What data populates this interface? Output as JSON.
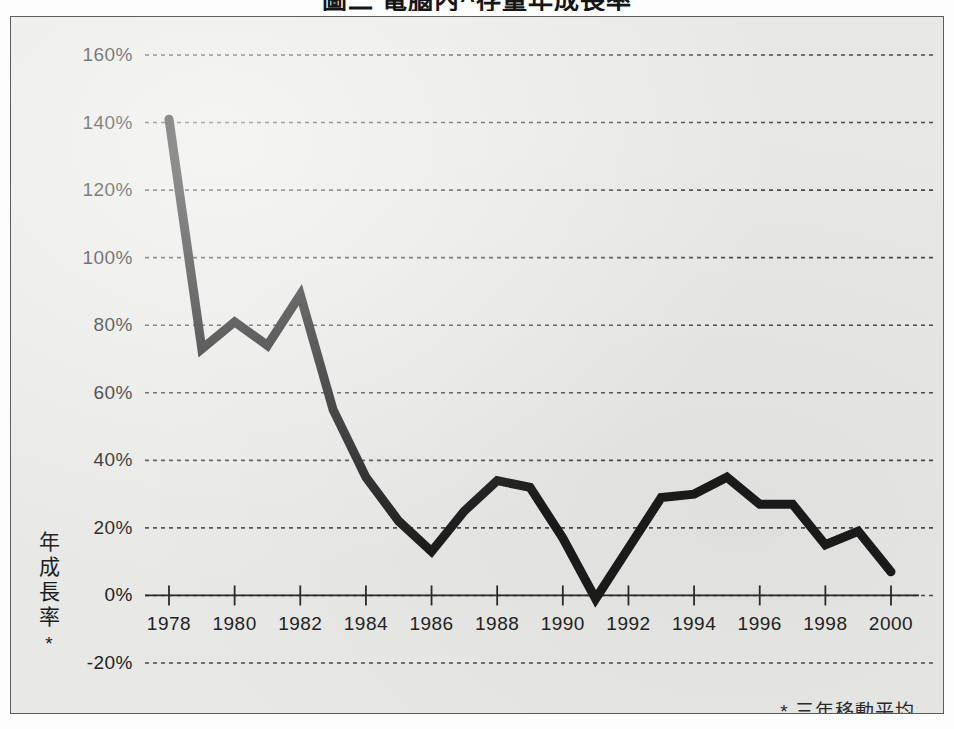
{
  "title": "圖二 電腦內^存量年成長率",
  "footnote": "* 三年移動平均",
  "y_axis_title": {
    "chars": [
      "年",
      "成",
      "長",
      "率"
    ],
    "marker": "*"
  },
  "colors": {
    "paper": "#e8e8e6",
    "line": "#1b1b1b",
    "grid": "#4a4a4a",
    "axis": "#2b2b2b",
    "text": "#232323",
    "frame_border": "#5d5d5d"
  },
  "chart_data": {
    "type": "line",
    "title": "圖二 電腦內^存量年成長率",
    "xlabel": "",
    "ylabel": "年成長率 *",
    "annotations": [
      "* 三年移動平均"
    ],
    "grid": true,
    "legend": "none",
    "xlim": [
      1978,
      2000
    ],
    "ylim": [
      -20,
      160
    ],
    "ytick_labels": [
      "160%",
      "140%",
      "120%",
      "100%",
      "80%",
      "60%",
      "40%",
      "20%",
      "0%",
      "-20%"
    ],
    "yticks": [
      160,
      140,
      120,
      100,
      80,
      60,
      40,
      20,
      0,
      -20
    ],
    "xtick_labels": [
      "1978",
      "1980",
      "1982",
      "1984",
      "1986",
      "1988",
      "1990",
      "1992",
      "1994",
      "1996",
      "1998",
      "2000"
    ],
    "xticks": [
      1978,
      1980,
      1982,
      1984,
      1986,
      1988,
      1990,
      1992,
      1994,
      1996,
      1998,
      2000
    ],
    "x": [
      1978,
      1979,
      1980,
      1981,
      1982,
      1983,
      1984,
      1985,
      1986,
      1987,
      1988,
      1989,
      1990,
      1991,
      1992,
      1993,
      1994,
      1995,
      1996,
      1997,
      1998,
      1999,
      2000
    ],
    "values": [
      141,
      73,
      81,
      74,
      89,
      55,
      35,
      22,
      13,
      25,
      34,
      32,
      17,
      -1,
      14,
      29,
      30,
      35,
      27,
      27,
      15,
      19,
      7
    ],
    "series": [
      {
        "name": "年成長率",
        "values": [
          141,
          73,
          81,
          74,
          89,
          55,
          35,
          22,
          13,
          25,
          34,
          32,
          17,
          -1,
          14,
          29,
          30,
          35,
          27,
          27,
          15,
          19,
          7
        ]
      }
    ]
  }
}
